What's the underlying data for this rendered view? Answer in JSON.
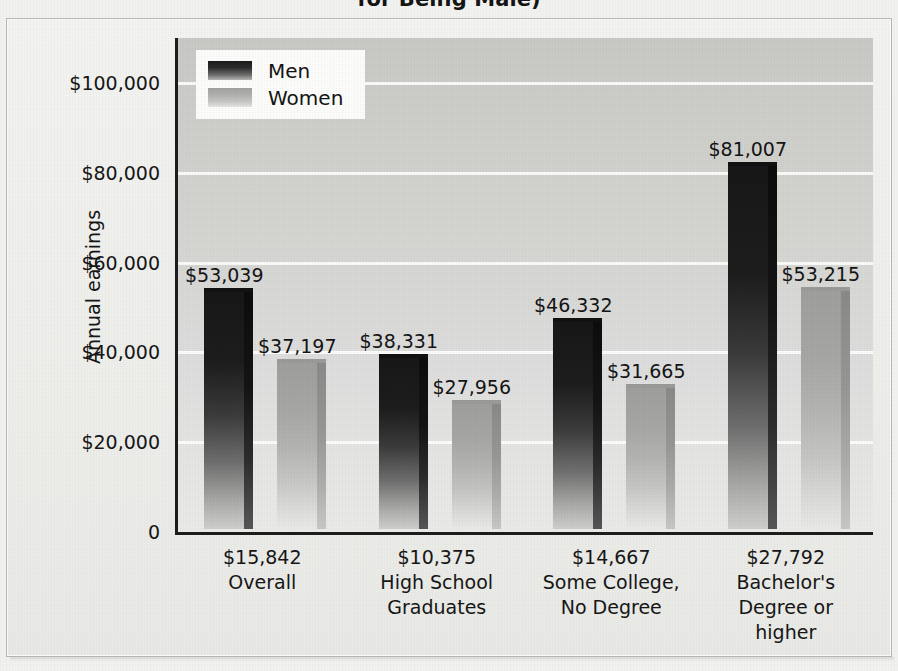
{
  "figure": {
    "title_visible_fragment": "for Being Male)",
    "ylabel": "Annual earnings"
  },
  "legend": {
    "series": [
      {
        "name": "Men",
        "label": "Men",
        "swatch": "men-swatch"
      },
      {
        "name": "Women",
        "label": "Women",
        "swatch": "women-swatch"
      }
    ]
  },
  "yaxis": {
    "ticks": [
      {
        "label": "$100,000",
        "value": 100000
      },
      {
        "label": "$80,000",
        "value": 80000
      },
      {
        "label": "$60,000",
        "value": 60000
      },
      {
        "label": "$40,000",
        "value": 40000
      },
      {
        "label": "$20,000",
        "value": 20000
      },
      {
        "label": "0",
        "value": 0
      }
    ]
  },
  "groups": [
    {
      "gap_label": "$15,842",
      "name_line1": "Overall",
      "name_line2": "",
      "name_line3": "",
      "men_label": "$53,039",
      "women_label": "$37,197"
    },
    {
      "gap_label": "$10,375",
      "name_line1": "High School",
      "name_line2": "Graduates",
      "name_line3": "",
      "men_label": "$38,331",
      "women_label": "$27,956"
    },
    {
      "gap_label": "$14,667",
      "name_line1": "Some College,",
      "name_line2": "No Degree",
      "name_line3": "",
      "men_label": "$46,332",
      "women_label": "$31,665"
    },
    {
      "gap_label": "$27,792",
      "name_line1": "Bachelor's",
      "name_line2": "Degree or",
      "name_line3": "higher",
      "men_label": "$53,215_placeholder",
      "women_label": "$53,215"
    }
  ],
  "chart_data": {
    "type": "bar",
    "title": "for Being Male)",
    "xlabel": "",
    "ylabel": "Annual earnings",
    "ylim": [
      0,
      110000
    ],
    "yticks": [
      0,
      20000,
      40000,
      60000,
      80000,
      100000
    ],
    "ytick_labels": [
      "0",
      "$20,000",
      "$40,000",
      "$60,000",
      "$80,000",
      "$100,000"
    ],
    "grid": true,
    "legend_position": "upper-left-inside",
    "categories": [
      "Overall",
      "High School Graduates",
      "Some College, No Degree",
      "Bachelor's Degree or higher"
    ],
    "category_gap_annotations": [
      "$15,842",
      "$10,375",
      "$14,667",
      "$27,792"
    ],
    "series": [
      {
        "name": "Men",
        "values": [
          53039,
          38331,
          46332,
          81007
        ],
        "labels": [
          "$53,039",
          "$38,331",
          "$46,332",
          "$81,007"
        ],
        "color": "#1d1d1d"
      },
      {
        "name": "Women",
        "values": [
          37197,
          27956,
          31665,
          53215
        ],
        "labels": [
          "$37,197",
          "$27,956",
          "$31,665",
          "$53,215"
        ],
        "color": "#b4b4b2"
      }
    ]
  }
}
